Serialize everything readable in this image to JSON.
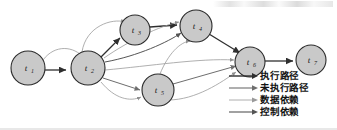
{
  "figure": {
    "type": "directed-graph",
    "node_fill": "#c9c9c9",
    "node_stroke": "#2b2b2b",
    "background": "#ffffff"
  },
  "nodes": [
    {
      "id": "t1",
      "base": "t",
      "sub": "1",
      "cx": 28,
      "cy": 68,
      "r": 17
    },
    {
      "id": "t2",
      "base": "t",
      "sub": "2",
      "cx": 88,
      "cy": 68,
      "r": 17
    },
    {
      "id": "t3",
      "base": "t",
      "sub": "3",
      "cx": 135,
      "cy": 30,
      "r": 15
    },
    {
      "id": "t4",
      "base": "t",
      "sub": "4",
      "cx": 196,
      "cy": 26,
      "r": 16
    },
    {
      "id": "t5",
      "base": "t",
      "sub": "5",
      "cx": 158,
      "cy": 90,
      "r": 16
    },
    {
      "id": "t6",
      "base": "t",
      "sub": "6",
      "cx": 250,
      "cy": 62,
      "r": 15
    },
    {
      "id": "t7",
      "base": "t",
      "sub": "7",
      "cx": 311,
      "cy": 60,
      "r": 15
    }
  ],
  "edges": [
    {
      "from": "t1",
      "to": "t2",
      "kind": "exec",
      "style": "straight"
    },
    {
      "from": "t1",
      "to": "t2",
      "kind": "data",
      "style": "arc-up"
    },
    {
      "from": "t2",
      "to": "t3",
      "kind": "exec",
      "style": "straight"
    },
    {
      "from": "t2",
      "to": "t3",
      "kind": "data",
      "style": "arc-up"
    },
    {
      "from": "t3",
      "to": "t4",
      "kind": "exec",
      "style": "straight"
    },
    {
      "from": "t2",
      "to": "t4",
      "kind": "data",
      "style": "arc-up"
    },
    {
      "from": "t2",
      "to": "t4",
      "kind": "control",
      "style": "arc-low"
    },
    {
      "from": "t2",
      "to": "t5",
      "kind": "nonexec",
      "style": "straight"
    },
    {
      "from": "t2",
      "to": "t5",
      "kind": "data",
      "style": "arc-down"
    },
    {
      "from": "t4",
      "to": "t6",
      "kind": "exec",
      "style": "straight"
    },
    {
      "from": "t5",
      "to": "t6",
      "kind": "nonexec",
      "style": "straight"
    },
    {
      "from": "t5",
      "to": "t4",
      "kind": "data",
      "style": "arc-up"
    },
    {
      "from": "t2",
      "to": "t6",
      "kind": "data",
      "style": "arc-long"
    },
    {
      "from": "t6",
      "to": "t7",
      "kind": "exec",
      "style": "straight"
    }
  ],
  "legend": {
    "items": [
      {
        "label": "执行路径",
        "kind": "exec",
        "color": "#2f2f2f"
      },
      {
        "label": "未执行路径",
        "kind": "nonexec",
        "color": "#6e6e6e"
      },
      {
        "label": "数据依赖",
        "kind": "data",
        "color": "#9a9a9a"
      },
      {
        "label": "控制依赖",
        "kind": "control",
        "color": "#555555"
      }
    ]
  }
}
